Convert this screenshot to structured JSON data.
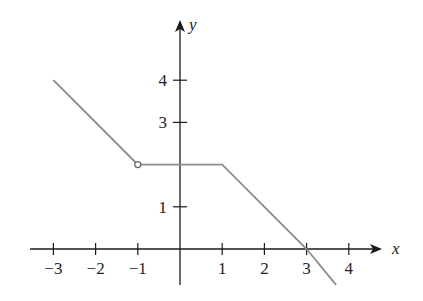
{
  "chart_data": {
    "type": "line",
    "title": "",
    "xlabel": "x",
    "ylabel": "y",
    "xlim": [
      -3.4,
      4.9
    ],
    "ylim": [
      -0.9,
      5.1
    ],
    "grid": false,
    "legend": null,
    "x_ticks": [
      -3,
      -2,
      -1,
      1,
      2,
      3,
      4
    ],
    "x_tick_labels": [
      "−3",
      "−2",
      "−1",
      "1",
      "2",
      "3",
      "4"
    ],
    "y_ticks": [
      1,
      3,
      4
    ],
    "y_tick_labels": [
      "1",
      "3",
      "4"
    ],
    "series": [
      {
        "name": "f(x) segment 1",
        "x": [
          -3,
          -1
        ],
        "y": [
          4,
          2
        ],
        "end_marker": "open-circle"
      },
      {
        "name": "f(x) segment 2",
        "x": [
          -1,
          1,
          3,
          3.7
        ],
        "y": [
          2,
          2,
          0,
          -0.85
        ]
      }
    ],
    "annotations": [
      {
        "type": "open-circle",
        "x": -1,
        "y": 2
      }
    ],
    "colors": {
      "axis": "#1a1a1a",
      "curve": "#8c8c8c"
    }
  }
}
